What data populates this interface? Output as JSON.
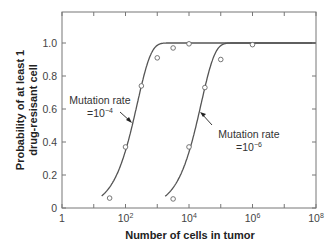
{
  "chart_data": {
    "type": "line",
    "title": "",
    "xlabel": "Number of cells in tumor",
    "ylabel_line1": "Probability of at least 1",
    "ylabel_line2": "drug-resisant cell",
    "xscale": "log",
    "xlim_log10": [
      0,
      8
    ],
    "ylim": [
      0,
      1.1
    ],
    "x_ticks": [
      {
        "log10": 0,
        "base": "1",
        "exp": ""
      },
      {
        "log10": 2,
        "base": "10",
        "exp": "2"
      },
      {
        "log10": 4,
        "base": "10",
        "exp": "4"
      },
      {
        "log10": 6,
        "base": "10",
        "exp": "6"
      },
      {
        "log10": 8,
        "base": "10",
        "exp": "8"
      }
    ],
    "x_minor_ticks_log10": [
      1,
      3,
      5,
      7
    ],
    "y_ticks": [
      {
        "value": 0,
        "label": "0"
      },
      {
        "value": 0.2,
        "label": "0.2"
      },
      {
        "value": 0.4,
        "label": "0.4"
      },
      {
        "value": 0.6,
        "label": "0.6"
      },
      {
        "value": 0.8,
        "label": "0.8"
      },
      {
        "value": 1.0,
        "label": "1.0"
      }
    ],
    "grid": false,
    "series": [
      {
        "name": "Mutation rate =10^-4",
        "label_line1": "Mutation rate",
        "label_prefix": "=10",
        "label_exp": "−4",
        "marker_x_log10": [
          1.5,
          2.0,
          2.5,
          3.0,
          3.5,
          4.0
        ],
        "marker_y": [
          0.06,
          0.37,
          0.74,
          0.91,
          0.97,
          0.995
        ]
      },
      {
        "name": "Mutation rate =10^-6",
        "label_line1": "Mutation rate",
        "label_prefix": "=10",
        "label_exp": "−6",
        "marker_x_log10": [
          3.5,
          4.0,
          4.5,
          5.0,
          6.0
        ],
        "marker_y": [
          0.055,
          0.37,
          0.73,
          0.9,
          0.99
        ]
      }
    ],
    "colors": {
      "line": "#555555",
      "marker_fill": "#ffffff",
      "marker_stroke": "#666666",
      "frame": "#777777"
    }
  }
}
